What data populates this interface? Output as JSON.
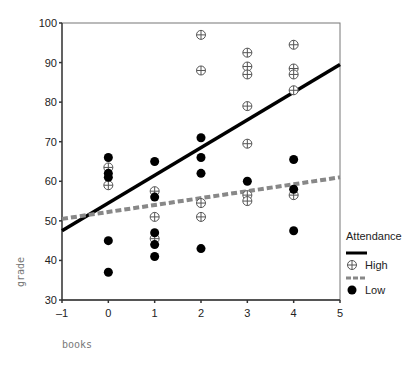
{
  "chart_data": {
    "type": "scatter",
    "title": "",
    "xlabel": "books",
    "ylabel": "grade",
    "xlim": [
      -1,
      5
    ],
    "ylim": [
      30,
      100
    ],
    "xticks": [
      -1,
      0,
      1,
      2,
      3,
      4,
      5
    ],
    "yticks": [
      30,
      40,
      50,
      60,
      70,
      80,
      90,
      100
    ],
    "grid": false,
    "legend": {
      "title": "Attendance",
      "position": "right",
      "entries": [
        {
          "label": "High",
          "marker": "circle-plus-open",
          "line": "solid",
          "color": "#000000"
        },
        {
          "label": "Low",
          "marker": "circle-filled",
          "line": "dashed",
          "color": "#888888"
        }
      ]
    },
    "series": [
      {
        "name": "High",
        "marker": "circle-plus-open",
        "color": "#000000",
        "points": [
          [
            0,
            63.5
          ],
          [
            0,
            59
          ],
          [
            1,
            57.5
          ],
          [
            1,
            51
          ],
          [
            1,
            45.5
          ],
          [
            2,
            97
          ],
          [
            2,
            88
          ],
          [
            2,
            54.5
          ],
          [
            2,
            51
          ],
          [
            3,
            92.5
          ],
          [
            3,
            89
          ],
          [
            3,
            87
          ],
          [
            3,
            79
          ],
          [
            3,
            69.5
          ],
          [
            3,
            56.5
          ],
          [
            3,
            55
          ],
          [
            4,
            94.5
          ],
          [
            4,
            88.5
          ],
          [
            4,
            87
          ],
          [
            4,
            83
          ],
          [
            4,
            56.5
          ]
        ],
        "fit_line": {
          "style": "solid",
          "color": "#000000",
          "x": [
            -1,
            5
          ],
          "y": [
            47.5,
            89.5
          ]
        }
      },
      {
        "name": "Low",
        "marker": "circle-filled",
        "color": "#000000",
        "points": [
          [
            0,
            66
          ],
          [
            0,
            62
          ],
          [
            0,
            61
          ],
          [
            0,
            45
          ],
          [
            0,
            37
          ],
          [
            1,
            65
          ],
          [
            1,
            56
          ],
          [
            1,
            47
          ],
          [
            1,
            44
          ],
          [
            1,
            41
          ],
          [
            2,
            71
          ],
          [
            2,
            66
          ],
          [
            2,
            62
          ],
          [
            2,
            43
          ],
          [
            3,
            60
          ],
          [
            4,
            65.5
          ],
          [
            4,
            58
          ],
          [
            4,
            47.5
          ]
        ],
        "fit_line": {
          "style": "dashed",
          "color": "#888888",
          "x": [
            -1,
            5
          ],
          "y": [
            50.5,
            61
          ]
        }
      }
    ]
  },
  "layout": {
    "plot_left": 62,
    "plot_right": 340,
    "plot_top": 23,
    "plot_bottom": 300
  }
}
